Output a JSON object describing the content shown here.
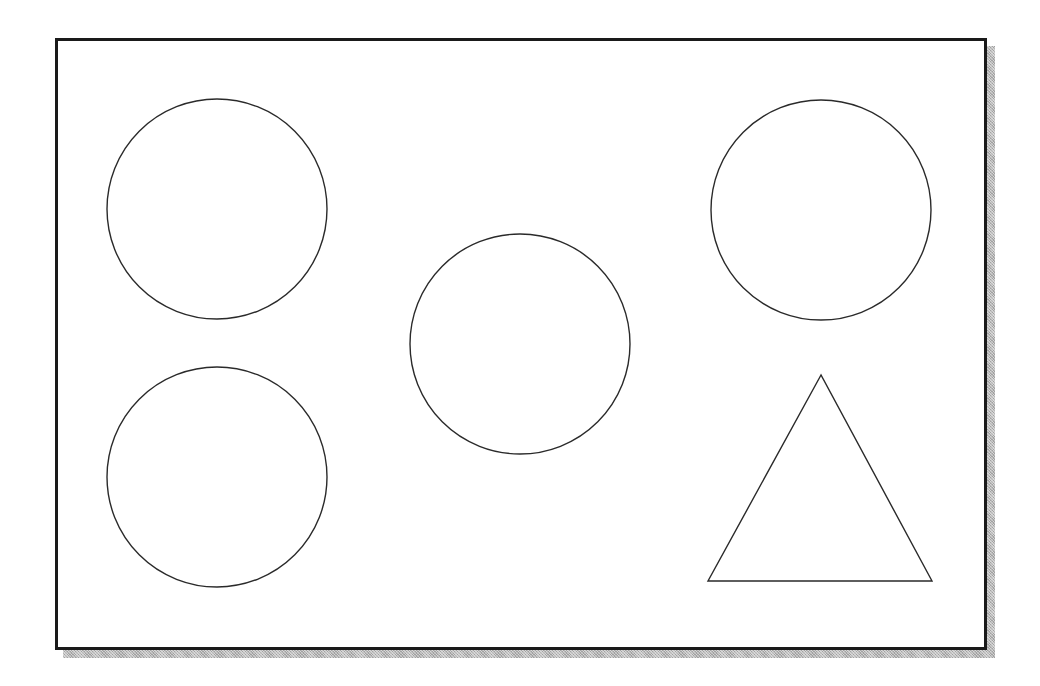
{
  "diagram": {
    "frame": {
      "x": 55,
      "y": 38,
      "width": 932,
      "height": 612,
      "stroke_color": "#1a1a1a",
      "shadow_color": "#b8b8b8"
    },
    "stroke_color": "#2a2a2a",
    "fill_color": "#ffffff",
    "shapes": [
      {
        "type": "circle",
        "name": "circle-top-left",
        "cx": 217,
        "cy": 209,
        "r": 110
      },
      {
        "type": "circle",
        "name": "circle-bottom-left",
        "cx": 217,
        "cy": 477,
        "r": 110
      },
      {
        "type": "circle",
        "name": "circle-center",
        "cx": 520,
        "cy": 344,
        "r": 110
      },
      {
        "type": "circle",
        "name": "circle-top-right",
        "cx": 821,
        "cy": 210,
        "r": 110
      },
      {
        "type": "triangle",
        "name": "triangle-bottom-right",
        "points": [
          [
            821,
            375
          ],
          [
            708,
            581
          ],
          [
            932,
            581
          ]
        ]
      }
    ]
  }
}
